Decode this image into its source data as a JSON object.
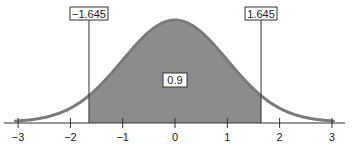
{
  "chart_data": {
    "type": "area",
    "title": "",
    "xlabel": "",
    "ylabel": "",
    "distribution": "standard normal",
    "mean": 0,
    "sd": 1,
    "xlim": [
      -3.3,
      3.25
    ],
    "x_ticks": [
      -3,
      -2,
      -1,
      0,
      1,
      2,
      3
    ],
    "x_tick_labels": [
      "−3",
      "−2",
      "−1",
      "0",
      "1",
      "2",
      "3"
    ],
    "shaded_region": {
      "from": -1.645,
      "to": 1.645,
      "area": 0.9
    },
    "annotations": [
      {
        "text": "−1.645",
        "x": -1.645,
        "role": "lower critical value"
      },
      {
        "text": "1.645",
        "x": 1.645,
        "role": "upper critical value"
      },
      {
        "text": "0.9",
        "x": 0,
        "role": "shaded area probability"
      }
    ],
    "grid": false,
    "legend": "none",
    "colors": {
      "curve": "#7a7a7a",
      "shade": "#8c8c8c",
      "axis": "#333333",
      "box_border": "#333333"
    }
  },
  "labels": {
    "lower_crit": "−1.645",
    "upper_crit": "1.645",
    "area": "0.9",
    "ticks": [
      "−3",
      "−2",
      "−1",
      "0",
      "1",
      "2",
      "3"
    ]
  }
}
